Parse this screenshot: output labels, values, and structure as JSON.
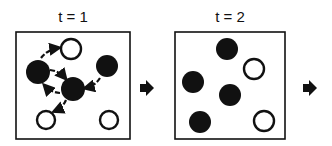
{
  "panels": [
    {
      "label": "t = 1",
      "box": {
        "x": 16,
        "y": 32,
        "w": 114,
        "h": 107
      },
      "circles": [
        {
          "cx": 71,
          "cy": 49,
          "r": 10,
          "filled": false
        },
        {
          "cx": 38,
          "cy": 72,
          "r": 12,
          "filled": true
        },
        {
          "cx": 107,
          "cy": 66,
          "r": 11,
          "filled": true
        },
        {
          "cx": 73,
          "cy": 89,
          "r": 12,
          "filled": true
        },
        {
          "cx": 46,
          "cy": 120,
          "r": 9,
          "filled": false
        },
        {
          "cx": 109,
          "cy": 120,
          "r": 9,
          "filled": false
        }
      ],
      "move_arrows": [
        {
          "from": [
            41,
            58
          ],
          "to": [
            58,
            48
          ]
        },
        {
          "from": [
            50,
            70
          ],
          "to": [
            65,
            78
          ]
        },
        {
          "from": [
            60,
            93
          ],
          "to": [
            45,
            86
          ]
        },
        {
          "from": [
            100,
            78
          ],
          "to": [
            86,
            88
          ]
        },
        {
          "from": [
            66,
            100
          ],
          "to": [
            55,
            111
          ]
        }
      ]
    },
    {
      "label": "t = 2",
      "box": {
        "x": 175,
        "y": 32,
        "w": 110,
        "h": 107
      },
      "circles": [
        {
          "cx": 227,
          "cy": 49,
          "r": 11,
          "filled": true
        },
        {
          "cx": 254,
          "cy": 69,
          "r": 10,
          "filled": false
        },
        {
          "cx": 193,
          "cy": 82,
          "r": 11,
          "filled": true
        },
        {
          "cx": 230,
          "cy": 95,
          "r": 11,
          "filled": true
        },
        {
          "cx": 200,
          "cy": 122,
          "r": 11,
          "filled": true
        },
        {
          "cx": 264,
          "cy": 121,
          "r": 10,
          "filled": false
        }
      ],
      "move_arrows": []
    }
  ],
  "step_arrows": [
    {
      "x": 146,
      "y": 88
    },
    {
      "x": 309,
      "y": 88
    }
  ],
  "colors": {
    "ink": "#111111",
    "background": "#ffffff"
  }
}
